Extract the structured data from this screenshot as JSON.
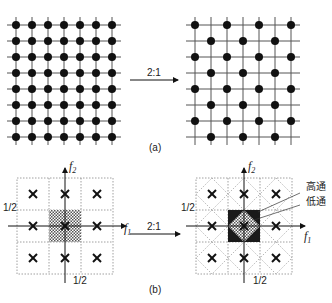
{
  "panel_a": {
    "caption": "(a)",
    "arrow_label": "2:1",
    "left_grid": {
      "cols": 7,
      "rows": 8,
      "pattern": "full lattice"
    },
    "right_grid": {
      "cols": 7,
      "rows": 8,
      "pattern": "quincunx"
    }
  },
  "panel_b": {
    "caption": "(b)",
    "arrow_label": "2:1",
    "left": {
      "axis_x_label": "f",
      "axis_x_sub": "1",
      "axis_y_label": "f",
      "axis_y_sub": "2",
      "tick_y": "1/2",
      "tick_x": "1/2",
      "marker": "×"
    },
    "right": {
      "axis_x_label": "f",
      "axis_x_sub": "1",
      "axis_y_label": "f",
      "axis_y_sub": "2",
      "tick_y": "1/2",
      "tick_x": "1/2",
      "marker": "×",
      "legend_high": "高通",
      "legend_low": "低通"
    }
  },
  "colors": {
    "ink": "#111111",
    "grid": "#666666",
    "dashed": "#888888",
    "fill_dark": "#1a1a1a"
  }
}
